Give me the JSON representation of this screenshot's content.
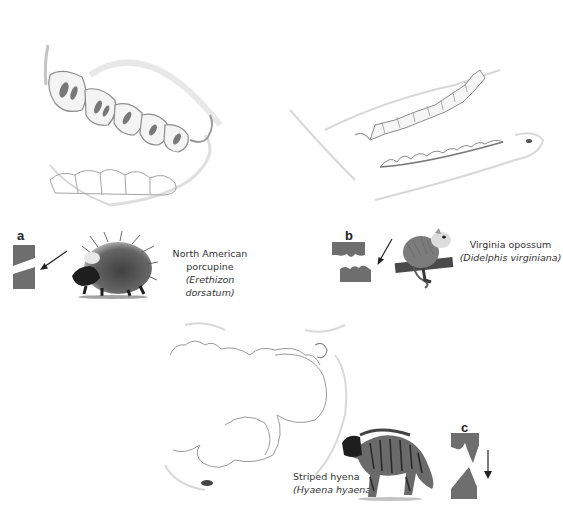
{
  "figure": {
    "panels": [
      {
        "id": "a",
        "letter": "a",
        "common_name_line1": "North American",
        "common_name_line2": "porcupine",
        "scientific_name": "(Erethizon dorsatum)",
        "animal_icon": "porcupine-illustration",
        "jaw_icon": "porcupine-jaw-sketch",
        "wear_diagram": "oblique-shear-blocks",
        "arrow_direction": "down-left"
      },
      {
        "id": "b",
        "letter": "b",
        "common_name": "Virginia opossum",
        "scientific_name": "(Didelphis virginiana)",
        "animal_icon": "opossum-illustration",
        "jaw_icon": "opossum-jaw-sketch",
        "wear_diagram": "cusped-interlocking-blocks",
        "arrow_direction": "down-left"
      },
      {
        "id": "c",
        "letter": "c",
        "common_name": "Striped hyena",
        "scientific_name": "(Hyaena hyaena)",
        "animal_icon": "hyena-illustration",
        "jaw_icon": "hyena-jaw-sketch",
        "wear_diagram": "crushing-cone-blocks",
        "arrow_direction": "down"
      }
    ],
    "colors": {
      "diagram_gray": "#6e6e6e",
      "sketch_line": "#9a9a9a",
      "text": "#333333",
      "background": "#ffffff"
    }
  }
}
